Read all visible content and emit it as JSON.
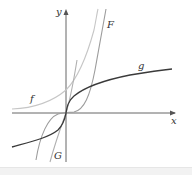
{
  "figure": {
    "axes": {
      "x_label": "x",
      "y_label": "y",
      "origin_px": [
        66,
        113
      ]
    },
    "curves": [
      {
        "name": "f",
        "label": "f",
        "color": "#c4c4c4",
        "description": "light gray increasing curve, asymptotic to x-axis on left, rising steeply"
      },
      {
        "name": "F",
        "label": "F",
        "color": "#9a9a9a",
        "description": "antiderivative, flat near origin, steep rise on right"
      },
      {
        "name": "g",
        "label": "g",
        "color": "#3a3a3a",
        "description": "dark cube-root-like curve through origin"
      },
      {
        "name": "G",
        "label": "G",
        "color": "#a8a8a8",
        "description": "steep curve through origin, descending to bottom left"
      }
    ],
    "colors": {
      "axis": "#555555",
      "background": "#ffffff",
      "divider": "#f2f2f2"
    }
  }
}
